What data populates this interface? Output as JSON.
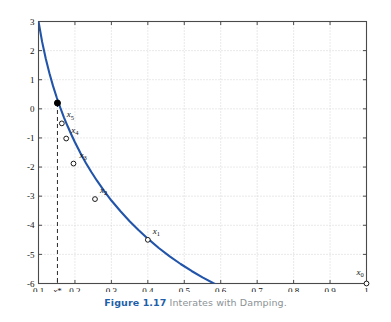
{
  "caption": {
    "label": "Figure 1.17",
    "text": "Interates with Damping."
  },
  "colors": {
    "curve": "#2255aa",
    "axis": "#4a4a4a",
    "grid": "#cfcfcf",
    "marker_edge": "#1a1a1a",
    "root_dot": "#000000",
    "dashed_line": "#2b2b2b",
    "caption_label": "#1f5fa9",
    "caption_text": "#8c9296",
    "background": "#ffffff"
  },
  "chart_data": {
    "type": "line",
    "title": "",
    "xlabel": "",
    "ylabel": "",
    "xlim": [
      0.1,
      1.0
    ],
    "ylim": [
      -6,
      3
    ],
    "grid": true,
    "legend": null,
    "x_ticks": [
      0.1,
      0.2,
      0.3,
      0.4,
      0.5,
      0.6,
      0.7,
      0.8,
      0.9,
      1.0
    ],
    "x_tick_labels": [
      "0.1",
      "0.2",
      "0.3",
      "0.4",
      "0.5",
      "0.6",
      "0.7",
      "0.8",
      "0.9",
      "1"
    ],
    "y_ticks": [
      3,
      2,
      1,
      0,
      -1,
      -2,
      -3,
      -4,
      -5,
      -6
    ],
    "y_tick_labels": [
      "3",
      "2",
      "1",
      "0",
      "-1",
      "-2",
      "-3",
      "-4",
      "-5",
      "-6"
    ],
    "special_x_tick": {
      "value": 0.152,
      "label": "x*"
    },
    "series": [
      {
        "name": "f(x)",
        "style": "solid",
        "color": "#2255aa",
        "points": [
          [
            0.1,
            3.0
          ],
          [
            0.11,
            2.3
          ],
          [
            0.12,
            1.72
          ],
          [
            0.13,
            1.22
          ],
          [
            0.14,
            0.78
          ],
          [
            0.15,
            0.39
          ],
          [
            0.16,
            0.03
          ],
          [
            0.17,
            -0.3
          ],
          [
            0.18,
            -0.6
          ],
          [
            0.19,
            -0.88
          ],
          [
            0.2,
            -1.15
          ],
          [
            0.215,
            -1.52
          ],
          [
            0.23,
            -1.86
          ],
          [
            0.245,
            -2.17
          ],
          [
            0.26,
            -2.46
          ],
          [
            0.28,
            -2.82
          ],
          [
            0.3,
            -3.15
          ],
          [
            0.325,
            -3.52
          ],
          [
            0.35,
            -3.86
          ],
          [
            0.375,
            -4.17
          ],
          [
            0.4,
            -4.46
          ],
          [
            0.43,
            -4.78
          ],
          [
            0.46,
            -5.07
          ],
          [
            0.49,
            -5.33
          ],
          [
            0.52,
            -5.57
          ],
          [
            0.55,
            -5.79
          ],
          [
            0.58,
            -5.99
          ],
          [
            0.61,
            -6.17
          ],
          [
            0.64,
            -6.34
          ],
          [
            0.67,
            -6.49
          ],
          [
            0.7,
            -6.63
          ],
          [
            0.75,
            -6.85
          ],
          [
            0.8,
            -7.04
          ],
          [
            0.85,
            -7.21
          ],
          [
            0.9,
            -7.36
          ],
          [
            0.95,
            -7.49
          ],
          [
            1.0,
            -7.61
          ]
        ]
      }
    ],
    "iterate_markers": [
      {
        "label": "x_0",
        "label_text": "x",
        "sub": "0",
        "x": 1.0,
        "y": -6.0,
        "marker": "open-circle",
        "label_dx": -10,
        "label_dy": -9
      },
      {
        "label": "x_1",
        "label_text": "x",
        "sub": "1",
        "x": 0.4,
        "y": -4.5,
        "marker": "open-circle",
        "label_dx": 5,
        "label_dy": -6
      },
      {
        "label": "x_2",
        "label_text": "x",
        "sub": "2",
        "x": 0.255,
        "y": -3.1,
        "marker": "open-circle",
        "label_dx": 5,
        "label_dy": -6
      },
      {
        "label": "x_3",
        "label_text": "x",
        "sub": "3",
        "x": 0.196,
        "y": -1.88,
        "marker": "open-circle",
        "label_dx": 6,
        "label_dy": -6
      },
      {
        "label": "x_4",
        "label_text": "x",
        "sub": "4",
        "x": 0.176,
        "y": -1.02,
        "marker": "open-circle",
        "label_dx": 5,
        "label_dy": -6
      },
      {
        "label": "x_5",
        "label_text": "x",
        "sub": "5",
        "x": 0.164,
        "y": -0.5,
        "marker": "open-circle",
        "label_dx": 5,
        "label_dy": -6
      }
    ],
    "root_point": {
      "x": 0.152,
      "y": 0.2,
      "marker": "filled-circle",
      "dashed_dropline": true,
      "dropline_to_y": -6
    }
  }
}
